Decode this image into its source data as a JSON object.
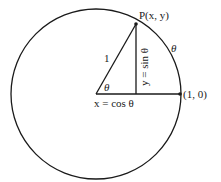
{
  "diagram": {
    "labels": {
      "point_p": "P(x, y)",
      "hypotenuse": "1",
      "vertical_side": "y = sin θ",
      "horizontal_side": "x = cos θ",
      "center_angle": "θ",
      "arc_angle": "θ",
      "point_on_axis": "(1, 0)"
    },
    "colors": {
      "stroke": "#1a1a1a",
      "background": "#ffffff"
    }
  }
}
